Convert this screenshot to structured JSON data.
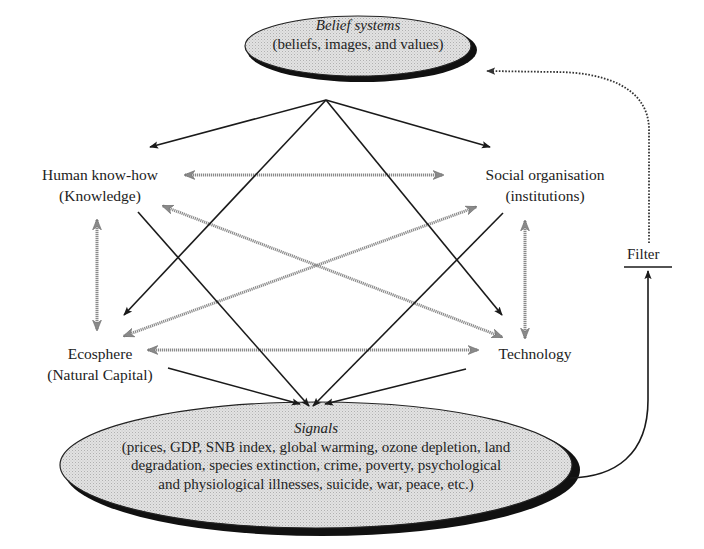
{
  "belief": {
    "title": "Belief systems",
    "subtitle": "(beliefs, images, and values)"
  },
  "nodes": {
    "knowledge": {
      "line1": "Human know-how",
      "line2": "(Knowledge)"
    },
    "social": {
      "line1": "Social organisation",
      "line2": "(institutions)"
    },
    "ecosphere": {
      "line1": "Ecosphere",
      "line2": "(Natural Capital)"
    },
    "technology": {
      "line1": "Technology"
    }
  },
  "signals": {
    "title": "Signals",
    "line1": "(prices, GDP, SNB index, global warming, ozone depletion, land",
    "line2": "degradation, species extinction, crime, poverty, psychological",
    "line3": "and physiological illnesses, suicide, war, peace, etc.)"
  },
  "filter": {
    "label": "Filter"
  },
  "colors": {
    "ellipse_fill": "#dcdcdc",
    "ellipse_shadow": "#111111",
    "solid_arrow": "#1a1a1a",
    "gray_arrow": "#8a8a8a",
    "dotted_feedback": "#444444"
  },
  "edges": {
    "solid": [
      "belief -> knowledge",
      "belief -> social",
      "belief -> ecosphere",
      "belief -> technology",
      "knowledge -> signals",
      "social -> signals",
      "ecosphere -> signals",
      "technology -> signals",
      "signals -> filter"
    ],
    "gray_bidirectional": [
      "knowledge <-> social",
      "knowledge <-> ecosphere",
      "knowledge <-> technology",
      "social <-> ecosphere",
      "social <-> technology",
      "ecosphere <-> technology"
    ],
    "dotted": [
      "filter -> belief"
    ]
  }
}
